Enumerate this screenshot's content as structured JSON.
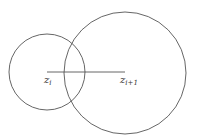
{
  "diagram": {
    "circles": [
      {
        "name": "small",
        "cx": 47,
        "cy": 72,
        "r": 38
      },
      {
        "name": "large",
        "cx": 125,
        "cy": 73,
        "r": 61
      }
    ],
    "segment": {
      "x1": 47,
      "y1": 72,
      "x2": 125,
      "y2": 72
    },
    "labels": {
      "zi": {
        "base": "z",
        "sub": "i"
      },
      "zi1": {
        "base": "z",
        "sub": "i+1"
      }
    },
    "stroke_color": "#555555"
  }
}
